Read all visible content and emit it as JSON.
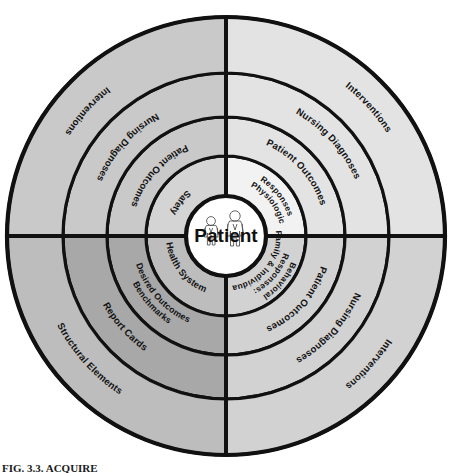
{
  "figure": {
    "caption": "FIG. 3.3. ACQUIRE",
    "center_label": "Patient",
    "center_icon": "patient-family-figures-icon"
  },
  "colors": {
    "outline": "#111111",
    "background": "#ffffff",
    "center_fill": "#ffffff",
    "quadrant_upper_left": "#c9c9c9",
    "quadrant_upper_right": "#e3e3e3",
    "quadrant_lower_left": "#a8a8a8",
    "quadrant_lower_right": "#d2d2d2"
  },
  "geometry": {
    "center_x": 226,
    "center_y": 236,
    "radii": [
      40,
      80,
      119,
      163,
      219
    ]
  },
  "quadrants": [
    {
      "id": "upper-left",
      "name": "safety-quadrant",
      "shade": "#c9c9c9",
      "rings": [
        {
          "level": 1,
          "label": "Safety"
        },
        {
          "level": 2,
          "label": "Patient Outcomes"
        },
        {
          "level": 3,
          "label": "Nursing Diagnoses"
        },
        {
          "level": 4,
          "label": "Interventions"
        }
      ]
    },
    {
      "id": "upper-right",
      "name": "physiologic-responses-quadrant",
      "shade": "#e3e3e3",
      "rings": [
        {
          "level": 1,
          "label": "Physiologic Responses",
          "lines": [
            "Physiologic",
            "Responses"
          ]
        },
        {
          "level": 2,
          "label": "Patient Outcomes"
        },
        {
          "level": 3,
          "label": "Nursing Diagnoses"
        },
        {
          "level": 4,
          "label": "Interventions"
        }
      ]
    },
    {
      "id": "lower-right",
      "name": "behavioral-responses-quadrant",
      "shade": "#d2d2d2",
      "rings": [
        {
          "level": 1,
          "label": "Behavioral Responses: Family & Individual",
          "lines": [
            "Behavioral",
            "Responses:",
            "Family & Individual"
          ]
        },
        {
          "level": 2,
          "label": "Patient Outcomes"
        },
        {
          "level": 3,
          "label": "Nursing Diagnoses"
        },
        {
          "level": 4,
          "label": "Interventions"
        }
      ]
    },
    {
      "id": "lower-left",
      "name": "health-system-quadrant",
      "shade": "#a8a8a8",
      "rings": [
        {
          "level": 1,
          "label": "Health System"
        },
        {
          "level": 2,
          "label": "Benchmarks Desired Outcomes",
          "lines": [
            "Benchmarks",
            "Desired Outcomes"
          ]
        },
        {
          "level": 3,
          "label": "Report Cards"
        },
        {
          "level": 4,
          "label": "Structural Elements"
        }
      ]
    }
  ]
}
